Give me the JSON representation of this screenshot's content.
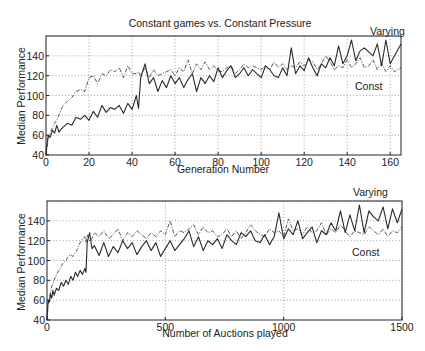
{
  "chart_data": [
    {
      "type": "line",
      "title": "Constant games vs. Constant Pressure",
      "xlabel": "Generation Number",
      "ylabel": "Median Performance",
      "xlim": [
        0,
        165
      ],
      "ylim": [
        40,
        160
      ],
      "xticks": [
        0,
        20,
        40,
        60,
        80,
        100,
        120,
        140,
        160
      ],
      "yticks": [
        40,
        60,
        80,
        100,
        120,
        140
      ],
      "grid": true,
      "annotations": [
        {
          "text": "Varying",
          "x": 155,
          "y": 162
        },
        {
          "text": "Const",
          "x": 150,
          "y": 112
        }
      ],
      "x": [
        0,
        1,
        2,
        3,
        4,
        5,
        6,
        7,
        8,
        10,
        12,
        14,
        16,
        18,
        20,
        22,
        24,
        26,
        28,
        30,
        32,
        34,
        36,
        38,
        40,
        42,
        43,
        44,
        46,
        48,
        50,
        52,
        54,
        56,
        58,
        60,
        62,
        64,
        66,
        68,
        70,
        72,
        74,
        76,
        78,
        80,
        82,
        84,
        86,
        88,
        90,
        92,
        94,
        96,
        98,
        100,
        102,
        104,
        106,
        108,
        110,
        112,
        114,
        116,
        118,
        120,
        122,
        124,
        126,
        128,
        130,
        132,
        134,
        136,
        138,
        140,
        142,
        144,
        146,
        148,
        150,
        152,
        154,
        156,
        158,
        160,
        162,
        165
      ],
      "series": [
        {
          "name": "Varying",
          "style": "solid",
          "values": [
            43,
            60,
            58,
            65,
            62,
            70,
            63,
            66,
            68,
            72,
            70,
            78,
            76,
            80,
            75,
            84,
            78,
            90,
            83,
            88,
            86,
            90,
            82,
            92,
            86,
            100,
            87,
            118,
            132,
            112,
            118,
            104,
            115,
            108,
            120,
            112,
            118,
            108,
            116,
            122,
            104,
            118,
            112,
            120,
            114,
            128,
            118,
            125,
            130,
            118,
            122,
            128,
            120,
            126,
            122,
            118,
            130,
            126,
            120,
            118,
            128,
            120,
            148,
            122,
            130,
            125,
            138,
            128,
            120,
            132,
            128,
            138,
            130,
            150,
            132,
            140,
            156,
            135,
            145,
            148,
            144,
            140,
            152,
            130,
            156,
            132,
            140,
            152
          ]
        },
        {
          "name": "Const",
          "style": "dash-dot",
          "values": [
            40,
            55,
            62,
            68,
            72,
            75,
            80,
            86,
            90,
            94,
            98,
            104,
            106,
            104,
            118,
            120,
            112,
            122,
            120,
            126,
            124,
            128,
            118,
            130,
            122,
            122,
            124,
            120,
            128,
            118,
            126,
            120,
            122,
            124,
            126,
            120,
            128,
            124,
            136,
            122,
            132,
            126,
            134,
            126,
            130,
            125,
            124,
            128,
            130,
            122,
            126,
            132,
            128,
            130,
            128,
            126,
            130,
            126,
            134,
            128,
            132,
            126,
            130,
            128,
            134,
            130,
            136,
            134,
            126,
            132,
            140,
            134,
            126,
            130,
            128,
            136,
            128,
            132,
            138,
            128,
            130,
            136,
            126,
            132,
            124,
            130,
            124,
            128
          ]
        }
      ]
    },
    {
      "type": "line",
      "title": "",
      "xlabel": "Number of Auctions played",
      "ylabel": "Median Performance",
      "xlim": [
        0,
        1500
      ],
      "ylim": [
        40,
        160
      ],
      "xticks": [
        0,
        500,
        1000,
        1500
      ],
      "yticks": [
        40,
        60,
        80,
        100,
        120,
        140
      ],
      "grid": true,
      "annotations": [
        {
          "text": "Varying",
          "x": 1380,
          "y": 163
        },
        {
          "text": "Const",
          "x": 1360,
          "y": 112
        }
      ],
      "x": [
        0,
        5,
        10,
        15,
        20,
        25,
        30,
        40,
        50,
        60,
        70,
        80,
        90,
        100,
        110,
        120,
        130,
        140,
        150,
        160,
        165,
        170,
        180,
        190,
        200,
        220,
        240,
        260,
        280,
        300,
        320,
        340,
        360,
        380,
        400,
        420,
        440,
        460,
        480,
        500,
        520,
        540,
        560,
        580,
        600,
        620,
        640,
        660,
        680,
        700,
        720,
        740,
        760,
        780,
        800,
        820,
        840,
        860,
        880,
        900,
        920,
        940,
        960,
        980,
        1000,
        1020,
        1040,
        1060,
        1080,
        1100,
        1120,
        1140,
        1160,
        1180,
        1200,
        1220,
        1240,
        1260,
        1280,
        1300,
        1320,
        1340,
        1360,
        1380,
        1400,
        1420,
        1440,
        1460,
        1480,
        1500
      ],
      "series": [
        {
          "name": "Varying",
          "style": "solid",
          "values": [
            43,
            60,
            58,
            66,
            62,
            70,
            65,
            72,
            70,
            78,
            74,
            80,
            76,
            84,
            80,
            88,
            84,
            90,
            86,
            92,
            88,
            118,
            128,
            112,
            115,
            105,
            118,
            104,
            114,
            108,
            120,
            112,
            118,
            106,
            114,
            120,
            110,
            118,
            104,
            112,
            120,
            110,
            116,
            122,
            130,
            114,
            124,
            110,
            120,
            116,
            122,
            112,
            126,
            120,
            116,
            128,
            124,
            130,
            120,
            118,
            126,
            116,
            124,
            148,
            122,
            132,
            126,
            140,
            122,
            128,
            134,
            118,
            130,
            126,
            138,
            130,
            150,
            128,
            146,
            130,
            156,
            128,
            150,
            144,
            140,
            154,
            132,
            152,
            138,
            152
          ]
        },
        {
          "name": "Const",
          "style": "dash-dot",
          "values": [
            40,
            56,
            62,
            68,
            74,
            76,
            80,
            86,
            90,
            94,
            98,
            100,
            104,
            106,
            104,
            108,
            112,
            118,
            122,
            124,
            118,
            126,
            120,
            122,
            128,
            124,
            130,
            122,
            126,
            132,
            120,
            128,
            124,
            130,
            126,
            122,
            128,
            124,
            130,
            126,
            140,
            124,
            130,
            128,
            132,
            136,
            126,
            134,
            128,
            130,
            124,
            126,
            132,
            124,
            130,
            122,
            128,
            136,
            130,
            126,
            124,
            132,
            128,
            130,
            124,
            142,
            130,
            132,
            126,
            134,
            128,
            130,
            138,
            126,
            132,
            128,
            136,
            130,
            124,
            130,
            128,
            126,
            134,
            130,
            126,
            132,
            124,
            130,
            128,
            134
          ]
        }
      ]
    }
  ]
}
